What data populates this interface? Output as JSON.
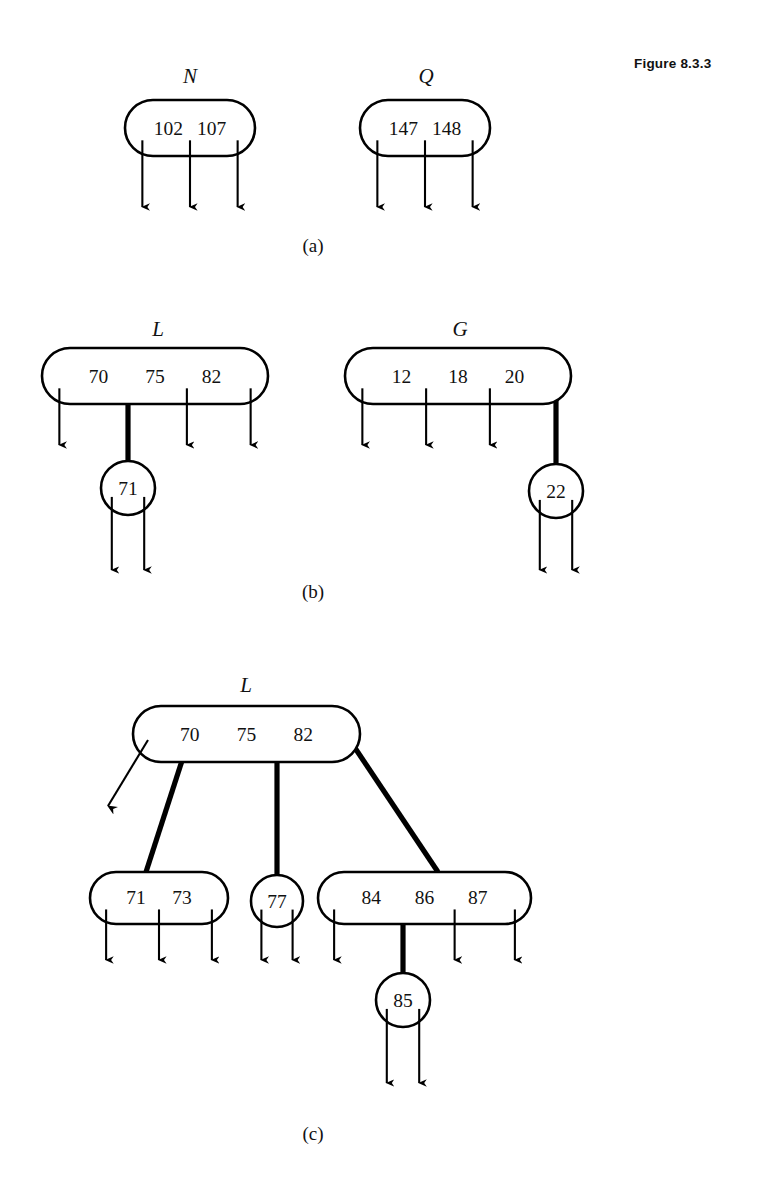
{
  "figure": {
    "caption": "Figure 8.3.3",
    "caption_x": 634,
    "caption_y": 64
  },
  "panels": [
    {
      "id": "a",
      "label": "(a)",
      "label_x": 313,
      "label_y": 252,
      "nodes": [
        {
          "id": "node-n",
          "name": "N",
          "shape": "stadium",
          "name_x": 190,
          "name_y": 83,
          "x": 125,
          "y": 100,
          "w": 130,
          "h": 56,
          "keys": [
            "102",
            "107"
          ],
          "slots": 3,
          "arrow_bottom": 217
        },
        {
          "id": "node-q",
          "name": "Q",
          "shape": "stadium",
          "name_x": 426,
          "name_y": 83,
          "x": 360,
          "y": 100,
          "w": 130,
          "h": 56,
          "keys": [
            "147",
            "148"
          ],
          "slots": 3,
          "arrow_bottom": 217
        }
      ],
      "links": []
    },
    {
      "id": "b",
      "label": "(b)",
      "label_x": 313,
      "label_y": 598,
      "nodes": [
        {
          "id": "node-l-b",
          "name": "L",
          "shape": "stadium",
          "name_x": 158,
          "name_y": 336,
          "x": 42,
          "y": 348,
          "w": 226,
          "h": 56,
          "keys": [
            "70",
            "75",
            "82"
          ],
          "slots": 4,
          "arrow_bottom": 455,
          "child_slot": 2
        },
        {
          "id": "node-71-b",
          "name": "",
          "shape": "circle",
          "cx": 128,
          "cy": 488,
          "r": 27,
          "keys": [
            "71"
          ],
          "slots": 2,
          "arrow_bottom": 580
        },
        {
          "id": "node-g-b",
          "name": "G",
          "shape": "stadium",
          "name_x": 460,
          "name_y": 336,
          "x": 345,
          "y": 348,
          "w": 226,
          "h": 56,
          "keys": [
            "12",
            "18",
            "20"
          ],
          "slots": 4,
          "arrow_bottom": 455,
          "child_slot": 4
        },
        {
          "id": "node-22-b",
          "name": "",
          "shape": "circle",
          "cx": 556,
          "cy": 491,
          "r": 27,
          "keys": [
            "22"
          ],
          "slots": 2,
          "arrow_bottom": 580
        }
      ],
      "links": [
        {
          "id": "edge-l-71",
          "x1": 128,
          "y1": 378,
          "x2": 128,
          "y2": 461
        },
        {
          "id": "edge-g-22",
          "x1": 556,
          "y1": 378,
          "x2": 556,
          "y2": 464
        }
      ]
    },
    {
      "id": "c",
      "label": "(c)",
      "label_x": 313,
      "label_y": 1140,
      "nodes": [
        {
          "id": "node-l-c",
          "name": "L",
          "shape": "stadium",
          "name_x": 246,
          "name_y": 692,
          "x": 133,
          "y": 706,
          "w": 227,
          "h": 56,
          "keys": [
            "70",
            "75",
            "82"
          ],
          "slots": 4,
          "arrow_bottom": 0
        },
        {
          "id": "node-71-73-c",
          "name": "",
          "shape": "stadium",
          "x": 90,
          "y": 872,
          "w": 138,
          "h": 52,
          "keys": [
            "71",
            "73"
          ],
          "slots": 3,
          "arrow_bottom": 970
        },
        {
          "id": "node-77-c",
          "name": "",
          "shape": "circle",
          "cx": 277,
          "cy": 901,
          "r": 26,
          "keys": [
            "77"
          ],
          "slots": 2,
          "arrow_bottom": 970
        },
        {
          "id": "node-84-86-87-c",
          "name": "",
          "shape": "stadium",
          "x": 318,
          "y": 872,
          "w": 213,
          "h": 52,
          "keys": [
            "84",
            "86",
            "87"
          ],
          "slots": 4,
          "arrow_bottom": 970,
          "child_slot": 2
        },
        {
          "id": "node-85-c",
          "name": "",
          "shape": "circle",
          "cx": 403,
          "cy": 1000,
          "r": 27,
          "keys": [
            "85"
          ],
          "slots": 2,
          "arrow_bottom": 1093
        }
      ],
      "links": [
        {
          "id": "edge-l-71-73",
          "x1": 190,
          "y1": 736,
          "x2": 146,
          "y2": 872
        },
        {
          "id": "edge-l-77",
          "x1": 277,
          "y1": 736,
          "x2": 277,
          "y2": 875
        },
        {
          "id": "edge-l-84",
          "x1": 347,
          "y1": 736,
          "x2": 438,
          "y2": 872
        },
        {
          "id": "edge-84-85",
          "x1": 403,
          "y1": 898,
          "x2": 403,
          "y2": 973
        }
      ],
      "dangling_arrow": {
        "id": "arrow-l-first-child",
        "x1": 148,
        "y1": 740,
        "x2": 108,
        "y2": 806
      }
    }
  ],
  "style": {
    "stroke_color": "#000000",
    "text_color": "#111111",
    "background": "#ffffff"
  }
}
